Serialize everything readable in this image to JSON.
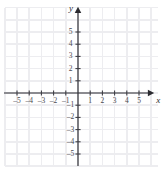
{
  "figure": {
    "width": 163,
    "height": 170,
    "background_color": "#ffffff"
  },
  "colors": {
    "grid": "#ededf0",
    "axis": "#2b2b30",
    "tick": "#3a3a40",
    "tick_label": "#4a4a4f",
    "axis_label": "#2b2b30"
  },
  "axis_labels": {
    "x": "x",
    "y": "y"
  },
  "chart_data": {
    "type": "scatter",
    "title": "",
    "subtitle": "",
    "xlabel": "x",
    "ylabel": "y",
    "xlim": [
      -6,
      6
    ],
    "ylim": [
      -6,
      6
    ],
    "xticks": [
      -5,
      -4,
      -3,
      -2,
      -1,
      1,
      2,
      3,
      4,
      5
    ],
    "yticks": [
      -5,
      -4,
      -3,
      -2,
      -1,
      1,
      2,
      3,
      4,
      5
    ],
    "xticklabels": [
      "–5",
      "–4",
      "–3",
      "–2",
      "–1",
      "1",
      "2",
      "3",
      "4",
      "5"
    ],
    "yticklabels": [
      "–5",
      "–4",
      "–3",
      "–2",
      "–1",
      "1",
      "2",
      "3",
      "4",
      "5"
    ],
    "grid": true,
    "grid_step": 1,
    "legend": false,
    "series": [
      {
        "name": "",
        "x": [],
        "y": []
      }
    ],
    "annotations": [],
    "axis_arrows": [
      "x-positive",
      "y-positive"
    ],
    "origin_label": ""
  },
  "geometry": {
    "origin_x": 78,
    "origin_y": 93,
    "unit": 12.2,
    "x_axis_start": 4,
    "x_axis_end": 150,
    "y_axis_start": 11,
    "y_axis_end": 166,
    "grid_left": 5,
    "grid_right": 158,
    "grid_top": 8,
    "grid_bottom": 166,
    "tick_half": 2.6,
    "arrow_size": 4.2
  }
}
